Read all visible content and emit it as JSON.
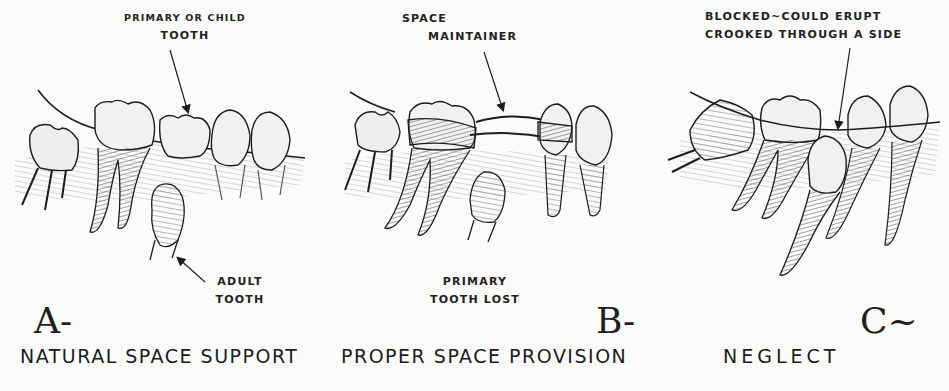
{
  "panels": [
    {
      "id": "A",
      "letter": "A-",
      "caption": "NATURAL SPACE SUPPORT",
      "labels": {
        "top_line1": "PRIMARY OR CHILD",
        "top_line2": "TOOTH",
        "bottom_line1": "ADULT",
        "bottom_line2": "TOOTH"
      }
    },
    {
      "id": "B",
      "letter": "B-",
      "caption": "PROPER SPACE PROVISION",
      "labels": {
        "top_line1": "SPACE",
        "top_line2": "MAINTAINER",
        "bottom_line1": "PRIMARY",
        "bottom_line2": "TOOTH LOST"
      }
    },
    {
      "id": "C",
      "letter": "C~",
      "caption": "NEGLECT",
      "labels": {
        "top_line1": "BLOCKED~COULD ERUPT",
        "top_line2": "CROOKED THROUGH A SIDE"
      }
    }
  ],
  "colors": {
    "ink": "#1d1d1d",
    "paper": "#fbfbf9",
    "shade": "#8a8a8a"
  }
}
